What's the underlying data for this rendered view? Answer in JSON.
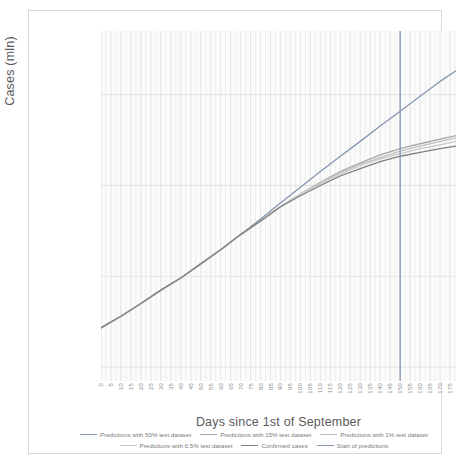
{
  "chart": {
    "type": "line",
    "ylabel": "Cases (mln)",
    "xlabel": "Days since 1st of September",
    "y_scale": "log",
    "y_ticks": [
      {
        "value": 160,
        "label": "160"
      },
      {
        "value": 80,
        "label": "80"
      },
      {
        "value": 40,
        "label": "40"
      },
      {
        "value": 20,
        "label": "20"
      }
    ],
    "ylim": [
      18,
      260
    ],
    "xlim": [
      0,
      178
    ],
    "x_ticks": [
      "0",
      "5",
      "10",
      "15",
      "20",
      "25",
      "30",
      "35",
      "40",
      "45",
      "50",
      "55",
      "60",
      "65",
      "70",
      "75",
      "80",
      "85",
      "90",
      "95",
      "100",
      "105",
      "110",
      "115",
      "120",
      "125",
      "130",
      "135",
      "140",
      "145",
      "150",
      "155",
      "160",
      "165",
      "170",
      "175"
    ],
    "grid": "vertical-minor-and-horizontal-major",
    "legend_position": "bottom",
    "annotations": [
      {
        "name": "start-of-predictions",
        "type": "vline",
        "x": 150
      }
    ]
  },
  "chart_data": {
    "type": "line",
    "title": "",
    "xlabel": "Days since 1st of September",
    "ylabel": "Cases (mln)",
    "y_scale": "log2",
    "ylim": [
      18,
      260
    ],
    "xlim": [
      0,
      178
    ],
    "grid": true,
    "legend_position": "bottom",
    "categories": [
      0,
      10,
      20,
      30,
      40,
      50,
      60,
      70,
      80,
      90,
      100,
      110,
      120,
      130,
      140,
      150,
      160,
      170,
      178
    ],
    "series": [
      {
        "name": "Predictions with 50% test dataset",
        "color": "#8497b0",
        "values": [
          27,
          29.5,
          32.5,
          36,
          39.5,
          44,
          49,
          55,
          62,
          70,
          79,
          89,
          100,
          112,
          126,
          141,
          158,
          177,
          192
        ]
      },
      {
        "name": "Predictions with 15% test dataset",
        "color": "#a6a6a6",
        "values": [
          27,
          29.5,
          32.5,
          36,
          39.5,
          44,
          49,
          55,
          61,
          68,
          75,
          82,
          89,
          95,
          101,
          106,
          110,
          114,
          117
        ]
      },
      {
        "name": "Predictions with 1% test dataset",
        "color": "#bfbfbf",
        "values": [
          27,
          29.5,
          32.5,
          36,
          39.5,
          44,
          49,
          55,
          61,
          68,
          75,
          82,
          88,
          94,
          99,
          104,
          108,
          112,
          115
        ]
      },
      {
        "name": "Predictions with 0.5% test dataset",
        "color": "#c9c9c9",
        "values": [
          27,
          29.5,
          32.5,
          36,
          39.5,
          44,
          49,
          55,
          61,
          68,
          75,
          81,
          87,
          93,
          98,
          102,
          106,
          109,
          112
        ]
      },
      {
        "name": "Confirmed cases",
        "color": "#7f7f7f",
        "values": [
          27,
          29.5,
          32.5,
          36,
          39.5,
          44,
          49,
          55,
          61,
          68,
          74,
          80,
          86,
          91,
          96,
          100,
          103,
          106,
          108
        ]
      }
    ],
    "vline": {
      "name": "Start of predictions",
      "x": 150,
      "color": "#8497b0"
    },
    "annotations": []
  },
  "legend": {
    "rows": [
      [
        {
          "label": "Predictions with 50% test dataset",
          "color": "#8497b0"
        },
        {
          "label": "Predictions with 15% test dataset",
          "color": "#a6a6a6"
        },
        {
          "label": "Predictions with 1% test dataset",
          "color": "#bfbfbf"
        }
      ],
      [
        {
          "label": "Predictions with 0.5% test dataset",
          "color": "#c9c9c9"
        },
        {
          "label": "Confirmed cases",
          "color": "#7f7f7f"
        },
        {
          "label": "Start of predictions",
          "color": "#8497b0"
        }
      ]
    ]
  }
}
